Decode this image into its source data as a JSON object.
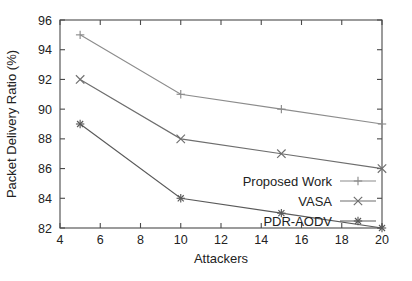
{
  "chart_data": {
    "type": "line",
    "title": "",
    "xlabel": "Attackers",
    "ylabel": "Packet Delivery Ratio (%)",
    "x": [
      5,
      10,
      15,
      20
    ],
    "xlim": [
      4,
      20
    ],
    "ylim": [
      82,
      96
    ],
    "xticks": [
      4,
      6,
      8,
      10,
      12,
      14,
      16,
      18,
      20
    ],
    "yticks": [
      82,
      84,
      86,
      88,
      90,
      92,
      94,
      96
    ],
    "xtick_labels": [
      "4",
      "6",
      "8",
      "10",
      "12",
      "14",
      "16",
      "18",
      "20"
    ],
    "ytick_labels": [
      "82",
      "84",
      "86",
      "88",
      "90",
      "92",
      "94",
      "96"
    ],
    "grid": false,
    "legend_position": "inside-lower-right",
    "series": [
      {
        "name": "Proposed Work",
        "marker": "plus",
        "color": "#8c8c8c",
        "x": [
          5,
          10,
          15,
          20
        ],
        "values": [
          95,
          91,
          90,
          89
        ]
      },
      {
        "name": "VASA",
        "marker": "cross",
        "color": "#6e6e6e",
        "x": [
          5,
          10,
          15,
          20
        ],
        "values": [
          92,
          88,
          87,
          86
        ]
      },
      {
        "name": "PDR-AODV",
        "marker": "asterisk",
        "color": "#5a5a5a",
        "x": [
          5,
          10,
          15,
          20
        ],
        "values": [
          89,
          84,
          83,
          82
        ]
      }
    ]
  },
  "figure": {
    "background_color": "#ffffff",
    "axis_color": "#4a4a4a",
    "text_color": "#222222"
  },
  "legend": {
    "entries": [
      {
        "label": "Proposed Work",
        "marker": "plus"
      },
      {
        "label": "VASA",
        "marker": "cross"
      },
      {
        "label": "PDR-AODV",
        "marker": "asterisk"
      }
    ]
  },
  "caption": {
    "text": ""
  }
}
